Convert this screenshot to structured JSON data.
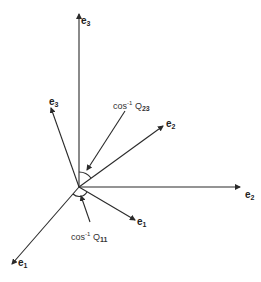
{
  "figure": {
    "type": "vector-rotation-diagram",
    "origin": [
      79,
      187
    ],
    "axes_fixed": [
      {
        "id": "e1",
        "base": "e",
        "sub": "1",
        "end": [
          12,
          264
        ]
      },
      {
        "id": "e2",
        "base": "e",
        "sub": "2",
        "end": [
          240,
          187
        ]
      },
      {
        "id": "e3",
        "base": "e",
        "sub": "3",
        "end": [
          79,
          14
        ]
      }
    ],
    "axes_rotated": [
      {
        "id": "e1prime",
        "base": "e",
        "sub": "1",
        "end": [
          135,
          220
        ]
      },
      {
        "id": "e2prime",
        "base": "e",
        "sub": "2",
        "end": [
          163,
          126
        ]
      },
      {
        "id": "e3prime",
        "base": "e",
        "sub": "3",
        "end": [
          51,
          108
        ]
      }
    ],
    "annotations": [
      {
        "id": "cos-q23",
        "prefix": "cos",
        "power": "-1",
        "sym": "Q",
        "sub": "23"
      },
      {
        "id": "cos-q11",
        "prefix": "cos",
        "power": "-1",
        "sym": "Q",
        "sub": "11"
      }
    ],
    "colors": {
      "line": "#2a2a2a",
      "background": "#ffffff"
    }
  }
}
